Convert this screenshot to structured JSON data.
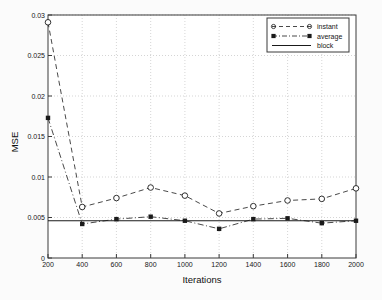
{
  "chart_data": {
    "type": "line",
    "title": "",
    "xlabel": "Iterations",
    "ylabel": "MSE",
    "x": [
      200,
      400,
      600,
      800,
      1000,
      1200,
      1400,
      1600,
      1800,
      2000
    ],
    "xlim": [
      200,
      2000
    ],
    "ylim": [
      0,
      0.03
    ],
    "xticks": [
      "200",
      "400",
      "600",
      "800",
      "1000",
      "1200",
      "1400",
      "1600",
      "1800",
      "2000"
    ],
    "yticks": [
      "0",
      "0.005",
      "0.01",
      "0.015",
      "0.02",
      "0.025",
      "0.03"
    ],
    "ytick_values": [
      0,
      0.005,
      0.01,
      0.015,
      0.02,
      0.025,
      0.03
    ],
    "grid": true,
    "legend_position": "upper right",
    "series": [
      {
        "name": "instant",
        "style": "dashed",
        "marker": "open-circle",
        "color": "#1a1a1a",
        "values": [
          0.0291,
          0.0063,
          0.0074,
          0.0087,
          0.0077,
          0.0055,
          0.0064,
          0.0071,
          0.0073,
          0.0086
        ]
      },
      {
        "name": "average",
        "style": "dash-dot",
        "marker": "filled-square",
        "color": "#1a1a1a",
        "values": [
          0.0173,
          0.0042,
          0.0048,
          0.0051,
          0.0046,
          0.0036,
          0.0048,
          0.0049,
          0.0043,
          0.0046
        ]
      },
      {
        "name": "block",
        "style": "solid",
        "marker": "none",
        "color": "#1a1a1a",
        "constant_value": 0.0046,
        "values": [
          0.0046,
          0.0046,
          0.0046,
          0.0046,
          0.0046,
          0.0046,
          0.0046,
          0.0046,
          0.0046,
          0.0046
        ]
      }
    ]
  },
  "axes": {
    "y_title": "MSE",
    "x_title": "Iterations"
  },
  "legend": {
    "entries": [
      {
        "label": "instant"
      },
      {
        "label": "average"
      },
      {
        "label": "block"
      }
    ]
  },
  "ytick_labels": {
    "t0": "0",
    "t1": "0.005",
    "t2": "0.01",
    "t3": "0.015",
    "t4": "0.02",
    "t5": "0.025",
    "t6": "0.03"
  },
  "xtick_labels": {
    "t0": "200",
    "t1": "400",
    "t2": "600",
    "t3": "800",
    "t4": "1000",
    "t5": "1200",
    "t6": "1400",
    "t7": "1600",
    "t8": "1800",
    "t9": "2000"
  }
}
